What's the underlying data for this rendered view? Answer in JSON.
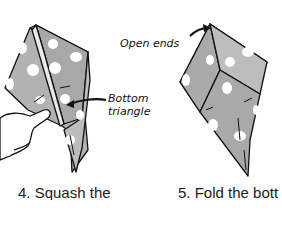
{
  "labels": {
    "open_ends": "Open ends",
    "bottom_triangle_line1": "Bottom",
    "bottom_triangle_line2": "triangle"
  },
  "captions": {
    "step4": "4. Squash the",
    "step5": "5. Fold the bott"
  },
  "colors": {
    "paper": "#a9a9a9",
    "paper_light": "#c4c4c4",
    "dots": "#ffffff",
    "ink": "#111111",
    "skin": "#ffffff"
  }
}
